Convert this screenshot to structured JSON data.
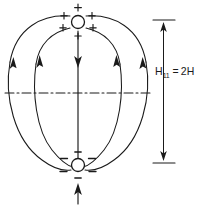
{
  "figure": {
    "background_color": "#ffffff",
    "line_color": "#1a1a1a",
    "width": 206,
    "height": 208
  },
  "poles": {
    "positive": {
      "label": "+",
      "sign_count": 6,
      "center_x": 78,
      "center_y": 22,
      "radius": 6.5,
      "signs": [
        "+",
        "+",
        "+",
        "+",
        "+",
        "+"
      ]
    },
    "negative": {
      "label": "−",
      "sign_count": 6,
      "center_x": 78,
      "center_y": 165,
      "radius": 6.5,
      "signs": [
        "−",
        "−",
        "−",
        "−",
        "−",
        "−"
      ]
    }
  },
  "dimension": {
    "text_main": "H",
    "text_subscript": "11",
    "text_equals": "=",
    "text_value": "2H",
    "full_text": "H11 = 2H",
    "top_y": 20,
    "bottom_y": 163,
    "axis_x": 163
  },
  "annotations": {
    "equator_line_style": "dash-dot",
    "center_arrow_direction": "down",
    "bottom_arrow_direction": "up",
    "field_line_arrow_direction": "down",
    "field_line_count": 5
  }
}
